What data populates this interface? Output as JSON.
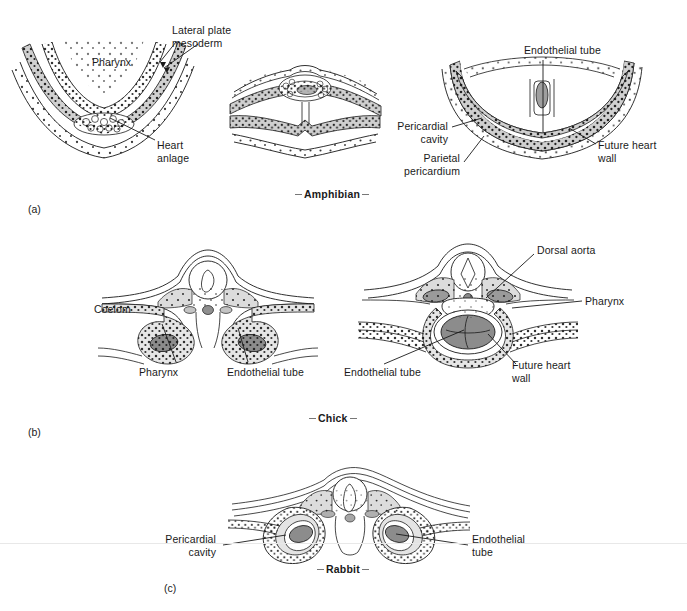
{
  "figure": {
    "background_color": "#ffffff",
    "ink_color": "#1a1a1a",
    "tissue_fill": "#d9d9d9",
    "endothelium_fill": "#9a9a9a"
  },
  "panels": [
    {
      "id": "a",
      "letter": "(a)",
      "species": "Amphibian",
      "stages": 3,
      "labels": [
        {
          "name": "lateral-plate-mesoderm",
          "text": "Lateral plate\nmesoderm"
        },
        {
          "name": "pharynx",
          "text": "Pharynx"
        },
        {
          "name": "heart-anlage",
          "text": "Heart\nanlage"
        },
        {
          "name": "endothelial-tube",
          "text": "Endothelial tube"
        },
        {
          "name": "pericardial-cavity",
          "text": "Pericardial\ncavity"
        },
        {
          "name": "parietal-pericardium",
          "text": "Parietal\npericardium"
        },
        {
          "name": "future-heart-wall",
          "text": "Future heart\nwall"
        }
      ]
    },
    {
      "id": "b",
      "letter": "(b)",
      "species": "Chick",
      "stages": 2,
      "labels": [
        {
          "name": "coelom",
          "text": "Coelom"
        },
        {
          "name": "pharynx-left",
          "text": "Pharynx"
        },
        {
          "name": "endothelial-tube-left",
          "text": "Endothelial tube"
        },
        {
          "name": "dorsal-aorta",
          "text": "Dorsal aorta"
        },
        {
          "name": "pharynx-right",
          "text": "Pharynx"
        },
        {
          "name": "endothelial-tube-right",
          "text": "Endothelial tube"
        },
        {
          "name": "future-heart-wall",
          "text": "Future heart\nwall"
        }
      ]
    },
    {
      "id": "c",
      "letter": "(c)",
      "species": "Rabbit",
      "stages": 1,
      "labels": [
        {
          "name": "pericardial-cavity",
          "text": "Pericardial\ncavity"
        },
        {
          "name": "endothelial-tube",
          "text": "Endothelial\ntube"
        }
      ]
    }
  ],
  "panel_a": {
    "letter": "(a)",
    "species": "Amphibian",
    "lateral_plate_mesoderm": "Lateral plate\nmesoderm",
    "pharynx": "Pharynx",
    "heart_anlage": "Heart\nanlage",
    "endothelial_tube": "Endothelial tube",
    "pericardial_cavity": "Pericardial\ncavity",
    "parietal_pericardium": "Parietal\npericardium",
    "future_heart_wall": "Future heart\nwall"
  },
  "panel_b": {
    "letter": "(b)",
    "species": "Chick",
    "coelom": "Coelom",
    "pharynx_left": "Pharynx",
    "endothelial_tube_left": "Endothelial tube",
    "dorsal_aorta": "Dorsal aorta",
    "pharynx_right": "Pharynx",
    "endothelial_tube_right": "Endothelial tube",
    "future_heart_wall": "Future heart\nwall"
  },
  "panel_c": {
    "letter": "(c)",
    "species": "Rabbit",
    "pericardial_cavity": "Pericardial\ncavity",
    "endothelial_tube": "Endothelial\ntube"
  }
}
